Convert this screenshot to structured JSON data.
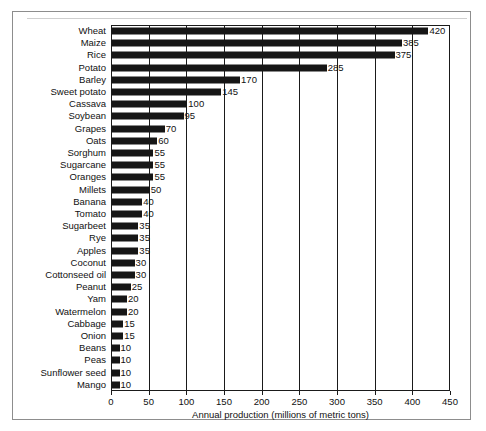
{
  "chart_data": {
    "type": "bar",
    "orientation": "horizontal",
    "title": "",
    "xlabel": "Annual production (millions of metric tons)",
    "ylabel": "",
    "xlim": [
      0,
      450
    ],
    "xticks": [
      0,
      50,
      100,
      150,
      200,
      250,
      300,
      350,
      400,
      450
    ],
    "grid": "vertical gridlines at every x tick",
    "legend": "none",
    "bar_color": "#161616",
    "value_labels": true,
    "categories": [
      "Wheat",
      "Maize",
      "Rice",
      "Potato",
      "Barley",
      "Sweet potato",
      "Cassava",
      "Soybean",
      "Grapes",
      "Oats",
      "Sorghum",
      "Sugarcane",
      "Oranges",
      "Millets",
      "Banana",
      "Tomato",
      "Sugarbeet",
      "Rye",
      "Apples",
      "Coconut",
      "Cottonseed oil",
      "Peanut",
      "Yam",
      "Watermelon",
      "Cabbage",
      "Onion",
      "Beans",
      "Peas",
      "Sunflower seed",
      "Mango"
    ],
    "values": [
      420,
      385,
      375,
      285,
      170,
      145,
      100,
      95,
      70,
      60,
      55,
      55,
      55,
      50,
      40,
      40,
      35,
      35,
      35,
      30,
      30,
      25,
      20,
      20,
      15,
      15,
      10,
      10,
      10,
      10
    ]
  }
}
